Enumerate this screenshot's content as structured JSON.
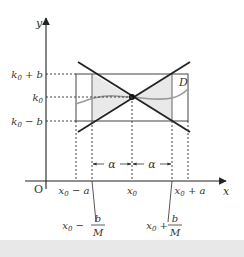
{
  "diagram": {
    "axes": {
      "x_label": "x",
      "y_label": "y",
      "origin_label": "O"
    },
    "y_ticks": [
      {
        "label_main": "k",
        "sub": "0",
        "suffix": " + b"
      },
      {
        "label_main": "k",
        "sub": "0",
        "suffix": ""
      },
      {
        "label_main": "k",
        "sub": "0",
        "suffix": " − b"
      }
    ],
    "x_ticks": [
      {
        "label_main": "x",
        "sub": "0",
        "suffix": " − a"
      },
      {
        "label_main": "x",
        "sub": "0",
        "suffix": ""
      },
      {
        "label_main": "x",
        "sub": "0",
        "suffix": " + a"
      }
    ],
    "region_label": "D",
    "alpha_left": "α",
    "alpha_right": "α",
    "bottom_labels": [
      {
        "prefix": "x",
        "sub": "0",
        "op": " −",
        "num": "b",
        "den": "M"
      },
      {
        "prefix": "x",
        "sub": "0",
        "op": " +",
        "num": "b",
        "den": "M"
      }
    ],
    "colors": {
      "line": "#222222",
      "rect": "#444444",
      "shade": "#e9e9e9",
      "curve": "#999999",
      "dotted": "#444444"
    }
  }
}
